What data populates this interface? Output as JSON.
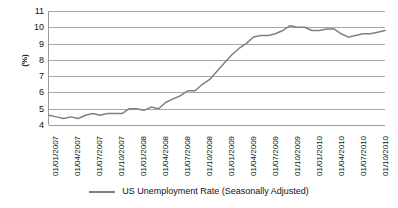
{
  "chart_data": {
    "type": "line",
    "title": "",
    "xlabel": "",
    "ylabel": "(%)",
    "ylim": [
      4,
      11
    ],
    "ytick_values": [
      11,
      10,
      9,
      8,
      7,
      6,
      5,
      4
    ],
    "grid": true,
    "legend_position": "bottom",
    "line_color": "#808080",
    "gridline_color": "#a6a6a6",
    "axis_color": "#9a9a9a",
    "xtick_labels": [
      "01/01/2007",
      "01/04/2007",
      "01/07/2007",
      "01/10/2007",
      "01/01/2008",
      "01/04/2008",
      "01/07/2008",
      "01/10/2008",
      "01/01/2009",
      "01/04/2009",
      "01/07/2009",
      "01/10/2009",
      "01/01/2010",
      "01/04/2010",
      "01/07/2010",
      "01/10/2010"
    ],
    "series": [
      {
        "name": "US Unemployment Rate (Seasonally Adjusted)",
        "x": [
          "01/01/2007",
          "01/02/2007",
          "01/03/2007",
          "01/04/2007",
          "01/05/2007",
          "01/06/2007",
          "01/07/2007",
          "01/08/2007",
          "01/09/2007",
          "01/10/2007",
          "01/11/2007",
          "01/12/2007",
          "01/01/2008",
          "01/02/2008",
          "01/03/2008",
          "01/04/2008",
          "01/05/2008",
          "01/06/2008",
          "01/07/2008",
          "01/08/2008",
          "01/09/2008",
          "01/10/2008",
          "01/11/2008",
          "01/12/2008",
          "01/01/2009",
          "01/02/2009",
          "01/03/2009",
          "01/04/2009",
          "01/05/2009",
          "01/06/2009",
          "01/07/2009",
          "01/08/2009",
          "01/09/2009",
          "01/10/2009",
          "01/11/2009",
          "01/12/2009",
          "01/01/2010",
          "01/02/2010",
          "01/03/2010",
          "01/04/2010",
          "01/05/2010",
          "01/06/2010",
          "01/07/2010",
          "01/08/2010",
          "01/09/2010",
          "01/10/2010",
          "01/11/2010"
        ],
        "values": [
          4.6,
          4.5,
          4.4,
          4.5,
          4.4,
          4.6,
          4.7,
          4.6,
          4.7,
          4.7,
          4.7,
          5.0,
          5.0,
          4.9,
          5.1,
          5.0,
          5.4,
          5.6,
          5.8,
          6.1,
          6.1,
          6.5,
          6.8,
          7.3,
          7.8,
          8.3,
          8.7,
          9.0,
          9.4,
          9.5,
          9.5,
          9.6,
          9.8,
          10.1,
          10.0,
          10.0,
          9.8,
          9.8,
          9.9,
          9.9,
          9.6,
          9.4,
          9.5,
          9.6,
          9.6,
          9.7,
          9.8
        ]
      }
    ]
  },
  "legend": {
    "entries": [
      {
        "label": "US Unemployment Rate (Seasonally Adjusted)"
      }
    ]
  }
}
